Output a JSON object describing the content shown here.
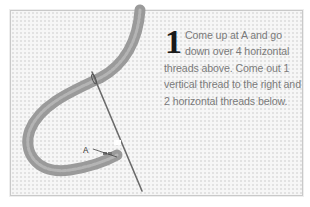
{
  "step": {
    "number": "1",
    "text": "Come up at A and go down over 4 horizontal threads above. Come out 1 vertical thread to the right and 2 horizontal threads below."
  },
  "illustration": {
    "label": "A",
    "thread_color": "#8a8a8a",
    "needle_color": "#6f6f6f",
    "canvas_color": "#f6f6f6"
  }
}
